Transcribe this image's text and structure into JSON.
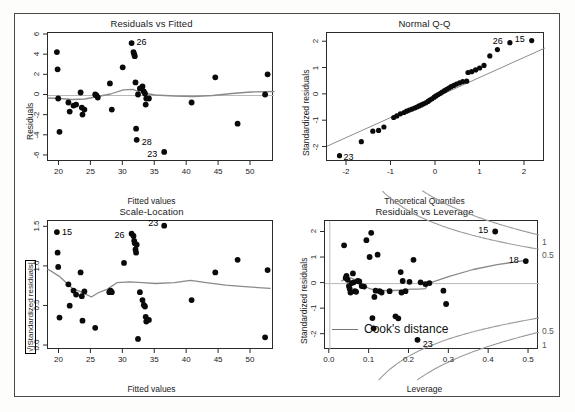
{
  "figure": {
    "kind": "regression-diagnostics",
    "background": "#ffffff",
    "point_color": "#000000",
    "smoother_color": "#808080",
    "reference_line_color": "#808080"
  },
  "panels": {
    "residuals_vs_fitted": {
      "title": "Residuals vs Fitted",
      "xlabel": "Fitted values",
      "ylabel": "Residuals"
    },
    "normal_qq": {
      "title": "Normal Q-Q",
      "xlabel": "Theoretical Quantiles",
      "ylabel": "Standardized residuals"
    },
    "scale_location": {
      "title": "Scale-Location",
      "xlabel": "Fitted values",
      "ylabel": "√|Standardized residuals|"
    },
    "residuals_vs_leverage": {
      "title": "Residuals vs Leverage",
      "xlabel": "Leverage",
      "ylabel": "Standardized residuals",
      "legend_label": "Cook's distance",
      "contour_labels_right": [
        "1",
        "0.5",
        "0.5",
        "1"
      ]
    }
  },
  "chart_data": [
    {
      "id": "residuals_vs_fitted",
      "type": "scatter",
      "title": "Residuals vs Fitted",
      "xlabel": "Fitted values",
      "ylabel": "Residuals",
      "xlim": [
        18.2,
        53.6
      ],
      "ylim": [
        -6.6,
        6.2
      ],
      "xticks": [
        20,
        25,
        30,
        35,
        40,
        45,
        50
      ],
      "yticks": [
        -6,
        -4,
        -2,
        0,
        2,
        4,
        6
      ],
      "grid": false,
      "reference_line": {
        "type": "hline",
        "y": 0
      },
      "x": [
        19.6,
        19.7,
        19.8,
        20.0,
        21.4,
        21.6,
        22.2,
        22.6,
        23.3,
        23.5,
        23.6,
        23.9,
        25.6,
        25.8,
        26.0,
        27.9,
        28.2,
        29.9,
        31.3,
        31.6,
        31.7,
        31.8,
        31.9,
        32.0,
        32.1,
        32.3,
        32.6,
        33.0,
        33.2,
        33.4,
        33.5,
        33.6,
        34.0,
        36.4,
        40.7,
        44.4,
        47.9,
        52.2,
        52.6
      ],
      "y": [
        4.3,
        2.6,
        -0.3,
        -3.6,
        -0.7,
        -1.6,
        -1.0,
        -0.9,
        0.3,
        -1.2,
        -1.9,
        -1.4,
        0.1,
        0.0,
        -0.2,
        1.2,
        -1.4,
        2.8,
        5.2,
        4.3,
        4.1,
        3.9,
        1.3,
        -3.3,
        -4.4,
        0.1,
        0.7,
        0.9,
        0.4,
        0.2,
        -0.9,
        -0.3,
        -0.3,
        -5.6,
        -0.7,
        1.8,
        -2.8,
        0.1,
        2.1
      ],
      "labeled_points": [
        {
          "label": "26",
          "x": 31.3,
          "y": 5.2
        },
        {
          "label": "28",
          "x": 32.1,
          "y": -4.4
        },
        {
          "label": "23",
          "x": 36.4,
          "y": -5.6
        }
      ],
      "smoother": {
        "x": [
          18.2,
          20.0,
          22.0,
          24.0,
          26.0,
          28.0,
          30.0,
          31.5,
          33.0,
          35.0,
          38.0,
          41.0,
          44.0,
          47.0,
          50.0,
          53.6
        ],
        "y": [
          -0.25,
          -0.3,
          -0.4,
          -0.35,
          -0.1,
          0.15,
          0.55,
          0.6,
          0.25,
          0.05,
          -0.05,
          -0.1,
          0.0,
          0.2,
          0.35,
          0.4
        ]
      }
    },
    {
      "id": "normal_qq",
      "type": "scatter",
      "title": "Normal Q-Q",
      "xlabel": "Theoretical Quantiles",
      "ylabel": "Standardized residuals",
      "xlim": [
        -2.45,
        2.45
      ],
      "ylim": [
        -2.55,
        2.35
      ],
      "xticks": [
        -2,
        -1,
        0,
        1,
        2
      ],
      "yticks": [
        -2,
        -1,
        0,
        1,
        2
      ],
      "grid": false,
      "reference_line": {
        "type": "qqline",
        "x": [
          -2.45,
          2.45
        ],
        "y": [
          -1.95,
          1.78
        ]
      },
      "x": [
        -2.17,
        -1.68,
        -1.42,
        -1.29,
        -1.17,
        -0.95,
        -0.88,
        -0.8,
        -0.72,
        -0.66,
        -0.6,
        -0.54,
        -0.48,
        -0.43,
        -0.38,
        -0.33,
        -0.28,
        -0.23,
        -0.18,
        -0.14,
        -0.09,
        -0.04,
        0.0,
        0.05,
        0.1,
        0.14,
        0.19,
        0.24,
        0.29,
        0.34,
        0.4,
        0.46,
        0.53,
        0.6,
        0.69,
        0.72,
        0.8,
        0.89,
        0.98,
        1.08,
        1.21,
        1.38,
        1.66,
        2.15
      ],
      "y": [
        -2.31,
        -1.78,
        -1.38,
        -1.35,
        -1.22,
        -0.86,
        -0.8,
        -0.72,
        -0.67,
        -0.62,
        -0.58,
        -0.54,
        -0.5,
        -0.46,
        -0.42,
        -0.38,
        -0.34,
        -0.3,
        -0.25,
        -0.2,
        -0.15,
        -0.09,
        -0.04,
        0.01,
        0.06,
        0.11,
        0.16,
        0.21,
        0.26,
        0.31,
        0.36,
        0.41,
        0.46,
        0.5,
        0.52,
        0.85,
        0.88,
        0.95,
        1.02,
        1.12,
        1.48,
        1.72,
        1.98,
        2.06
      ],
      "labeled_points": [
        {
          "label": "23",
          "x": -2.17,
          "y": -2.31
        },
        {
          "label": "26",
          "x": 1.66,
          "y": 1.98
        },
        {
          "label": "15",
          "x": 2.15,
          "y": 2.06
        }
      ]
    },
    {
      "id": "scale_location",
      "type": "scatter",
      "title": "Scale-Location",
      "xlabel": "Fitted values",
      "ylabel": "√|Standardized residuals|",
      "xlim": [
        18.2,
        53.6
      ],
      "ylim": [
        -0.05,
        1.58
      ],
      "xticks": [
        20,
        25,
        30,
        35,
        40,
        45,
        50
      ],
      "yticks": [
        0.0,
        0.5,
        1.0,
        1.5
      ],
      "ytick_labels": [
        "0.0",
        "0.5",
        "1.0",
        "1.5"
      ],
      "grid": false,
      "x": [
        19.6,
        19.7,
        19.8,
        20.0,
        21.4,
        21.6,
        22.2,
        22.6,
        23.3,
        23.5,
        23.6,
        23.9,
        25.6,
        27.8,
        28.0,
        28.2,
        30.1,
        31.3,
        31.6,
        31.7,
        31.8,
        31.9,
        32.0,
        32.1,
        32.3,
        32.6,
        33.0,
        33.2,
        33.4,
        33.5,
        33.6,
        34.0,
        36.4,
        40.7,
        44.4,
        47.9,
        52.2,
        52.6
      ],
      "y": [
        1.44,
        1.18,
        1.0,
        0.36,
        0.78,
        0.51,
        0.7,
        0.65,
        0.93,
        0.63,
        0.32,
        0.69,
        0.23,
        0.68,
        0.7,
        0.68,
        1.05,
        1.42,
        1.39,
        1.33,
        1.3,
        1.22,
        1.18,
        1.28,
        0.09,
        0.68,
        0.58,
        0.52,
        0.5,
        0.37,
        0.31,
        0.33,
        1.52,
        0.58,
        0.93,
        1.09,
        0.11,
        0.96
      ],
      "labeled_points": [
        {
          "label": "15",
          "x": 19.6,
          "y": 1.44
        },
        {
          "label": "26",
          "x": 31.3,
          "y": 1.42
        },
        {
          "label": "23",
          "x": 36.4,
          "y": 1.52
        }
      ],
      "smoother": {
        "x": [
          18.2,
          20.0,
          22.0,
          23.5,
          25.0,
          26.0,
          27.5,
          29.0,
          31.0,
          33.0,
          35.0,
          38.0,
          40.5,
          43.0,
          46.0,
          49.0,
          53.0
        ],
        "y": [
          0.97,
          0.88,
          0.73,
          0.68,
          0.62,
          0.67,
          0.72,
          0.8,
          0.81,
          0.8,
          0.79,
          0.8,
          0.83,
          0.8,
          0.77,
          0.75,
          0.73
        ]
      }
    },
    {
      "id": "residuals_vs_leverage",
      "type": "scatter",
      "title": "Residuals vs Leverage",
      "xlabel": "Leverage",
      "ylabel": "Standardized residuals",
      "xlim": [
        -0.012,
        0.525
      ],
      "ylim": [
        -2.6,
        2.45
      ],
      "xticks": [
        0.0,
        0.1,
        0.2,
        0.3,
        0.4,
        0.5
      ],
      "xtick_labels": [
        "0.0",
        "0.1",
        "0.2",
        "0.3",
        "0.4",
        "0.5"
      ],
      "yticks": [
        -2,
        -1,
        0,
        1,
        2
      ],
      "grid": false,
      "reference_line": {
        "type": "hline",
        "y": 0
      },
      "vertical_reference": {
        "x": 0.0
      },
      "cooks_levels": [
        0.5,
        1.0
      ],
      "legend": "Cook's distance",
      "x": [
        0.036,
        0.04,
        0.042,
        0.045,
        0.048,
        0.05,
        0.052,
        0.055,
        0.058,
        0.06,
        0.063,
        0.066,
        0.07,
        0.074,
        0.08,
        0.086,
        0.092,
        0.1,
        0.104,
        0.107,
        0.11,
        0.112,
        0.115,
        0.12,
        0.125,
        0.13,
        0.15,
        0.165,
        0.172,
        0.178,
        0.18,
        0.183,
        0.19,
        0.2,
        0.21,
        0.22,
        0.228,
        0.24,
        0.25,
        0.285,
        0.292,
        0.415,
        0.492
      ],
      "y": [
        1.5,
        0.22,
        0.3,
        0.15,
        -0.1,
        -0.2,
        -0.35,
        0.02,
        0.4,
        0.05,
        -0.3,
        -0.32,
        0.1,
        0.08,
        -0.1,
        -0.12,
        1.7,
        1.04,
        1.99,
        -1.35,
        -1.75,
        -0.52,
        -0.28,
        1.13,
        -0.3,
        -0.35,
        -0.3,
        -1.28,
        -1.36,
        0.45,
        -0.35,
        0.1,
        -0.3,
        0.07,
        0.93,
        -2.2,
        0.05,
        -0.02,
        0.02,
        -0.28,
        -0.8,
        2.04,
        0.88
      ],
      "labeled_points": [
        {
          "label": "15",
          "x": 0.415,
          "y": 2.04
        },
        {
          "label": "18",
          "x": 0.492,
          "y": 0.88
        },
        {
          "label": "23",
          "x": 0.228,
          "y": -2.2
        }
      ],
      "smoother": {
        "x": [
          0.03,
          0.045,
          0.06,
          0.08,
          0.1,
          0.12,
          0.14,
          0.16,
          0.185,
          0.205,
          0.225,
          0.24,
          0.25,
          0.3,
          0.36,
          0.42,
          0.495
        ],
        "y": [
          0.1,
          0.26,
          0.18,
          -0.02,
          -0.2,
          -0.28,
          -0.27,
          -0.27,
          -0.25,
          -0.22,
          -0.22,
          -0.2,
          0.02,
          0.28,
          0.55,
          0.74,
          0.92
        ]
      }
    }
  ]
}
